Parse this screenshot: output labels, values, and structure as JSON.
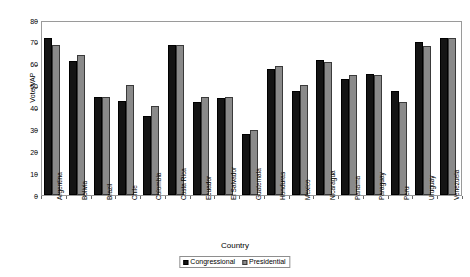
{
  "chart_data": {
    "type": "bar",
    "title": "",
    "xlabel": "Country",
    "ylabel": "Vote/VAP",
    "ylim": [
      0,
      80
    ],
    "ytick_step": 10,
    "yticks": [
      0,
      10,
      20,
      30,
      40,
      50,
      60,
      70,
      80
    ],
    "grid": false,
    "legend_position": "bottom-center",
    "categories": [
      "Argentina",
      "Bolivia",
      "Brazil",
      "Chile",
      "Colombia",
      "Costa Rica",
      "Ecuador",
      "El Salvador",
      "Guatemala",
      "Honduras",
      "Mexico",
      "Nicaragua",
      "Panama",
      "Paraguay",
      "Peru",
      "Uruguay",
      "Venezuela"
    ],
    "series": [
      {
        "name": "Congressional",
        "color": "#141414",
        "values": [
          71.8,
          61.4,
          45.0,
          42.8,
          36.0,
          68.8,
          42.3,
          44.4,
          28.0,
          57.7,
          47.7,
          61.5,
          52.9,
          55.4,
          47.4,
          69.8,
          71.6
        ]
      },
      {
        "name": "Presidential",
        "color": "#8a8a8a",
        "values": [
          68.5,
          63.8,
          44.8,
          50.1,
          40.5,
          68.8,
          44.6,
          44.8,
          29.7,
          59.0,
          50.2,
          60.6,
          54.9,
          54.7,
          42.3,
          68.0,
          71.9
        ]
      }
    ]
  },
  "axes": {
    "y_title": "Vote/VAP",
    "x_title": "Country"
  },
  "legend": {
    "items": [
      {
        "label": "Congressional",
        "swatch": "black-square-icon"
      },
      {
        "label": "Presidential",
        "swatch": "gray-square-icon"
      }
    ]
  }
}
